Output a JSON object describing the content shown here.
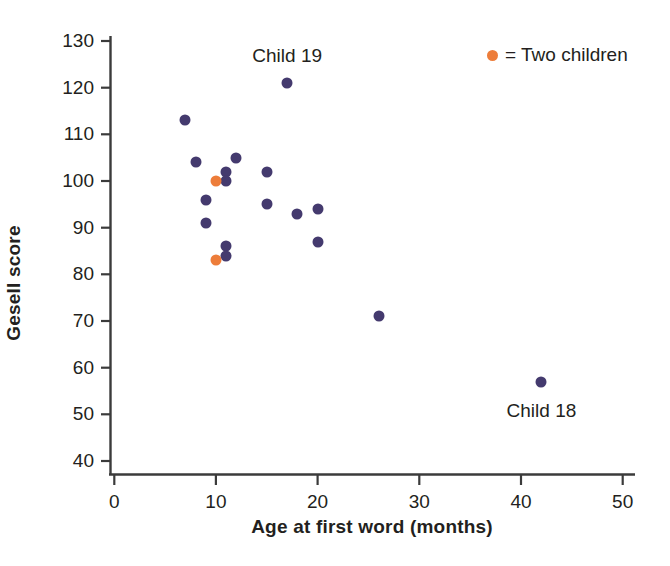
{
  "chart_data": {
    "type": "scatter",
    "title": "",
    "xlabel": "Age at first word (months)",
    "ylabel": "Gesell score",
    "xlim": [
      0,
      52
    ],
    "ylim": [
      38,
      132
    ],
    "xticks": [
      0,
      10,
      20,
      30,
      40,
      50
    ],
    "yticks": [
      40,
      50,
      60,
      70,
      80,
      90,
      100,
      110,
      120,
      130
    ],
    "xtick_labels": [
      "0",
      "10",
      "20",
      "30",
      "40",
      "50"
    ],
    "ytick_labels": [
      "40",
      "50",
      "60",
      "70",
      "80",
      "90",
      "100",
      "110",
      "120",
      "130"
    ],
    "grid": false,
    "legend_position": "top-right",
    "series": [
      {
        "name": "One child",
        "color": "#443a6e",
        "marker": "circle",
        "points": [
          {
            "x": 7,
            "y": 113
          },
          {
            "x": 8,
            "y": 104
          },
          {
            "x": 9,
            "y": 96
          },
          {
            "x": 9,
            "y": 91
          },
          {
            "x": 11,
            "y": 102
          },
          {
            "x": 11,
            "y": 100
          },
          {
            "x": 11,
            "y": 86
          },
          {
            "x": 11,
            "y": 84
          },
          {
            "x": 12,
            "y": 105
          },
          {
            "x": 15,
            "y": 102
          },
          {
            "x": 15,
            "y": 95
          },
          {
            "x": 17,
            "y": 121
          },
          {
            "x": 18,
            "y": 93
          },
          {
            "x": 20,
            "y": 94
          },
          {
            "x": 20,
            "y": 87
          },
          {
            "x": 26,
            "y": 71
          },
          {
            "x": 42,
            "y": 57
          }
        ]
      },
      {
        "name": "Two children",
        "color": "#ed7d3a",
        "marker": "circle",
        "points": [
          {
            "x": 10,
            "y": 100
          },
          {
            "x": 10,
            "y": 83
          }
        ]
      }
    ],
    "annotations": [
      {
        "text": "Child 19",
        "x": 17,
        "y": 126.5
      },
      {
        "text": "Child 18",
        "x": 42,
        "y": 50.5
      }
    ]
  },
  "legend": {
    "swatch_color": "#ed7d3a",
    "text": "= Two children"
  },
  "axis": {
    "x_title": "Age at first word (months)",
    "y_title": "Gesell score",
    "line_color": "#3b3b3b"
  }
}
